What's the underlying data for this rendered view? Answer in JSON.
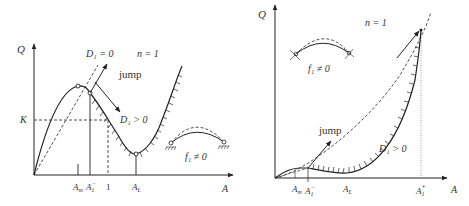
{
  "left_panel": {
    "y_axis_label": "Q",
    "x_axis_label": "A",
    "k_label": "K",
    "d1_zero_label": "D₁ = 0",
    "n_label": "n = 1",
    "jump_label": "jump",
    "d1_pos_label": "D₁ > 0",
    "f1_label": "f₁ ≠ 0",
    "x_ticks": [
      "Aₘ",
      "A₁⁻",
      "1",
      "A_L"
    ],
    "tick_am": "A",
    "tick_am_sub": "m",
    "tick_a1": "A",
    "tick_a1_sub": "1",
    "tick_a1_sup": "−",
    "tick_one": "1",
    "tick_al": "A",
    "tick_al_sub": "L"
  },
  "right_panel": {
    "y_axis_label": "Q",
    "x_axis_label": "A",
    "n_label": "n = 1",
    "jump_label": "jump",
    "d1_pos_label": "D₁ > 0",
    "f1_label": "f₁ ≠ 0",
    "tick_am": "A",
    "tick_am_sub": "m",
    "tick_a1m": "A",
    "tick_a1m_sub": "1",
    "tick_a1m_sup": "−",
    "tick_al": "A",
    "tick_al_sub": "L",
    "tick_a1p": "A",
    "tick_a1p_sub": "1",
    "tick_a1p_sup": "+"
  }
}
